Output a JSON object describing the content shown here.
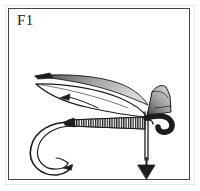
{
  "figure": {
    "label": "F1",
    "caption": "",
    "background_color": "#ffffff",
    "ink_color": "#1c1c1c",
    "frame_color": "#444444",
    "outer_edge_color": "#e8e8e8",
    "shading_color": "#8a8a8a"
  },
  "illustration": {
    "subject": "fly-tying-step-diagram",
    "parts": [
      {
        "name": "hook-shank",
        "label": ""
      },
      {
        "name": "hook-bend",
        "label": ""
      },
      {
        "name": "hook-point",
        "label": ""
      },
      {
        "name": "hook-barb",
        "label": ""
      },
      {
        "name": "hook-eye",
        "label": ""
      },
      {
        "name": "wrapped-body",
        "label": ""
      },
      {
        "name": "thread-head",
        "label": ""
      },
      {
        "name": "upper-wing",
        "label": ""
      },
      {
        "name": "lower-wing",
        "label": ""
      },
      {
        "name": "wing-tip-marker",
        "label": ""
      },
      {
        "name": "quill-feather",
        "label": ""
      },
      {
        "name": "hackle-stem",
        "label": ""
      },
      {
        "name": "tying-thread",
        "label": ""
      },
      {
        "name": "direction-arrow",
        "label": ""
      }
    ]
  }
}
